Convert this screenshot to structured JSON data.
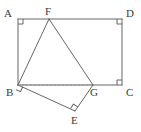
{
  "figure": {
    "kind": "geometry-diagram",
    "canvas": {
      "width": 141,
      "height": 132
    },
    "stroke_color": "#555555",
    "dashed_color": "#8a8a8a",
    "label_color": "#3a3a3a",
    "background_color": "#ffffff",
    "stroke_width": 0.9,
    "points": [
      {
        "id": "A",
        "label": "A",
        "x": 18,
        "y": 19,
        "label_x": 4,
        "label_y": 8
      },
      {
        "id": "D",
        "label": "D",
        "x": 122,
        "y": 19,
        "label_x": 126,
        "label_y": 8
      },
      {
        "id": "C",
        "label": "C",
        "x": 122,
        "y": 85,
        "label_x": 126,
        "label_y": 87
      },
      {
        "id": "B",
        "label": "B",
        "x": 18,
        "y": 85,
        "label_x": 6,
        "label_y": 87
      },
      {
        "id": "F",
        "label": "F",
        "x": 49,
        "y": 19,
        "label_x": 45,
        "label_y": 6
      },
      {
        "id": "G",
        "label": "G",
        "x": 93,
        "y": 85,
        "label_x": 90,
        "label_y": 87
      },
      {
        "id": "E",
        "label": "E",
        "x": 75,
        "y": 111,
        "label_x": 71,
        "label_y": 115
      }
    ],
    "solid_segments": [
      {
        "name": "segment-A-D",
        "from": "A",
        "to": "D"
      },
      {
        "name": "segment-D-C",
        "from": "D",
        "to": "C"
      },
      {
        "name": "segment-C-B",
        "from": "C",
        "to": "B"
      },
      {
        "name": "segment-B-A",
        "from": "B",
        "to": "A"
      },
      {
        "name": "segment-F-B",
        "from": "F",
        "to": "B"
      },
      {
        "name": "segment-F-G",
        "from": "F",
        "to": "G"
      },
      {
        "name": "segment-B-E",
        "from": "B",
        "to": "E"
      },
      {
        "name": "segment-E-G",
        "from": "E",
        "to": "G"
      }
    ],
    "dashed_segments": [
      {
        "name": "segment-B-G-dashed",
        "from": "B",
        "to": "G"
      }
    ],
    "right_angle_marks": [
      {
        "name": "right-angle-A",
        "at": "A",
        "size": 5,
        "rotation": 0
      },
      {
        "name": "right-angle-D",
        "at": "D",
        "size": 5,
        "rotation": 90
      },
      {
        "name": "right-angle-C",
        "at": "C",
        "size": 5,
        "rotation": 180
      },
      {
        "name": "right-angle-B",
        "at": "B",
        "size": 5,
        "rotation": 24
      },
      {
        "name": "right-angle-E",
        "at": "E",
        "size": 5,
        "rotation": 212
      }
    ]
  }
}
